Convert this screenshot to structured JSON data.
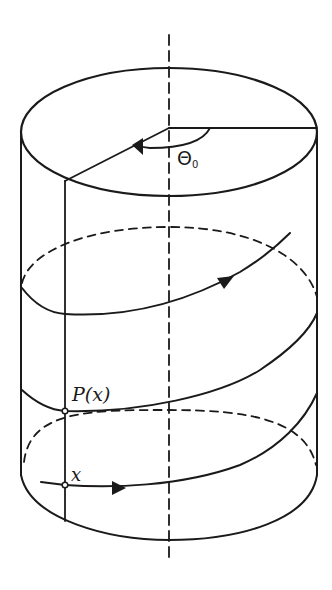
{
  "diagram": {
    "type": "cylinder-helix",
    "labels": {
      "theta": "Θ",
      "theta_subscript": "0",
      "point_p": "P(x)",
      "point_x": "x"
    },
    "colors": {
      "stroke": "#1a1a1a",
      "background": "#ffffff"
    },
    "elements": {
      "axis": "vertical dashed symmetry axis",
      "top_face": "solid ellipse with radius line and angle arc",
      "hidden_ellipses": 2,
      "helix_segments": 3,
      "arrows": 3,
      "marked_points": [
        "P(x)",
        "x"
      ]
    }
  }
}
